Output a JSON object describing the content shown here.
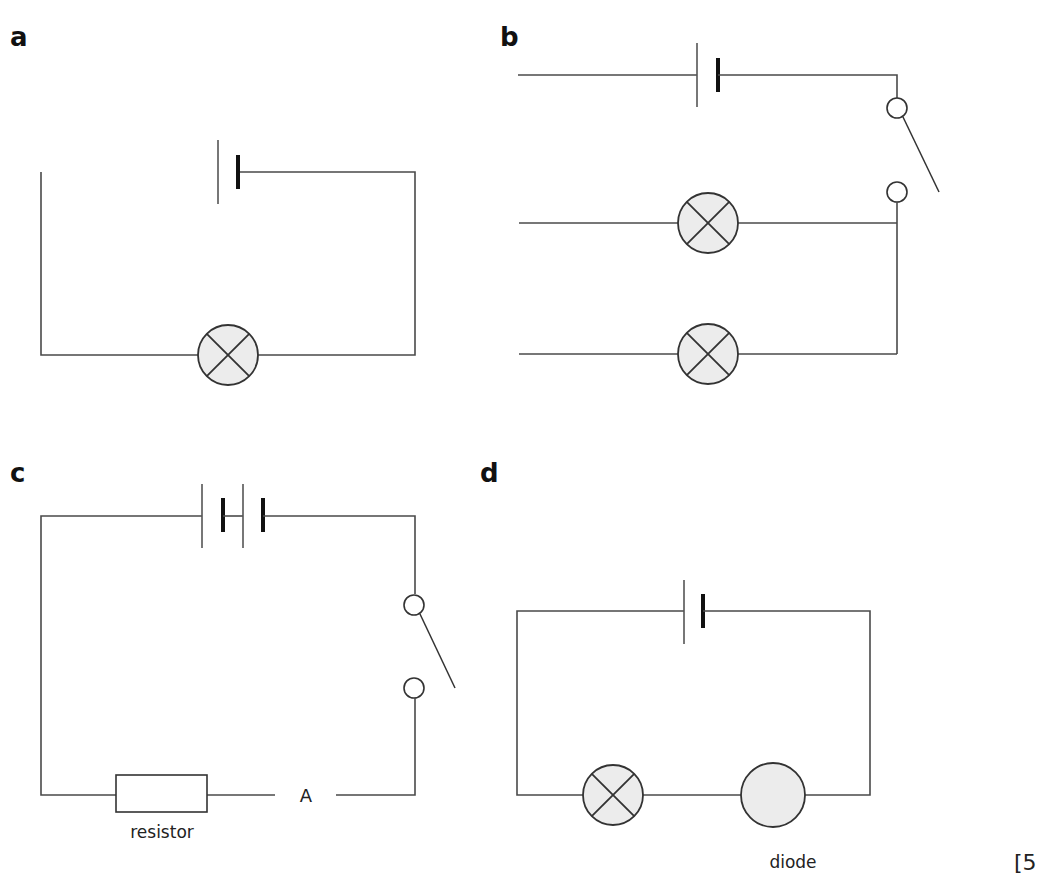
{
  "figure": {
    "colors": {
      "wire": "#4a4a4a",
      "lamp_fill": "#ececec",
      "background": "#ffffff"
    }
  },
  "panels": [
    {
      "label": "a",
      "components": [
        "cell",
        "lamp"
      ],
      "note": "incomplete circuit: left wire not connected to cell"
    },
    {
      "label": "b",
      "components": [
        "cell",
        "switch",
        "lamp",
        "lamp"
      ],
      "note": "open switch, two lamp branches with open left ends"
    },
    {
      "label": "c",
      "components": [
        "cell",
        "cell",
        "switch",
        "ammeter",
        "resistor"
      ],
      "resistor_label": "resistor",
      "ammeter_label": "A"
    },
    {
      "label": "d",
      "components": [
        "cell",
        "lamp",
        "diode"
      ],
      "diode_label": "diode"
    }
  ],
  "marks": "[5"
}
